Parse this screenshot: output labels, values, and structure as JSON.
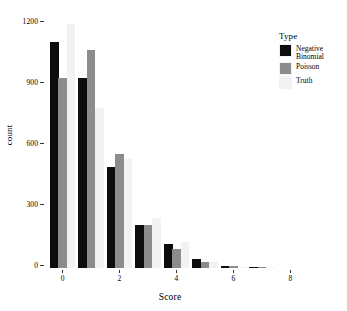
{
  "chart_data": {
    "type": "bar",
    "title": "",
    "subtitle": "",
    "xlabel": "Score",
    "ylabel": "count",
    "categories": [
      "0",
      "1",
      "2",
      "3",
      "4",
      "5",
      "6",
      "7"
    ],
    "x": [
      0,
      1,
      2,
      3,
      4,
      5,
      6,
      7
    ],
    "series": [
      {
        "name": "Negative\nBinomial",
        "color": "#0d0d0d",
        "values": [
          1110,
          935,
          495,
          210,
          120,
          45,
          12,
          5
        ]
      },
      {
        "name": "Poisson",
        "color": "#8c8c8c",
        "values": [
          935,
          1075,
          560,
          210,
          95,
          30,
          8,
          2
        ]
      },
      {
        "name": "Truth",
        "color": "#f2f2f2",
        "values": [
          1200,
          790,
          535,
          245,
          130,
          30,
          5,
          2
        ]
      }
    ],
    "ylim": [
      0,
      1260
    ],
    "xlim": [
      -0.65,
      8.2
    ],
    "y_ticks": [
      0,
      300,
      600,
      900,
      1200
    ],
    "y_tick_labels": [
      "0",
      "300",
      "600",
      "900",
      "1200"
    ],
    "x_ticks": [
      0,
      2,
      4,
      6,
      8
    ],
    "x_tick_labels": [
      "0",
      "2",
      "4",
      "6",
      "8"
    ],
    "grid": false,
    "legend": {
      "title": "Type",
      "position": "right",
      "entries": [
        {
          "label": "Negative\nBinomial",
          "color": "#0d0d0d"
        },
        {
          "label": "Poisson",
          "color": "#8c8c8c"
        },
        {
          "label": "Truth",
          "color": "#f2f2f2"
        }
      ]
    },
    "background": "#ffffff",
    "panel_background": "#ffffff"
  }
}
